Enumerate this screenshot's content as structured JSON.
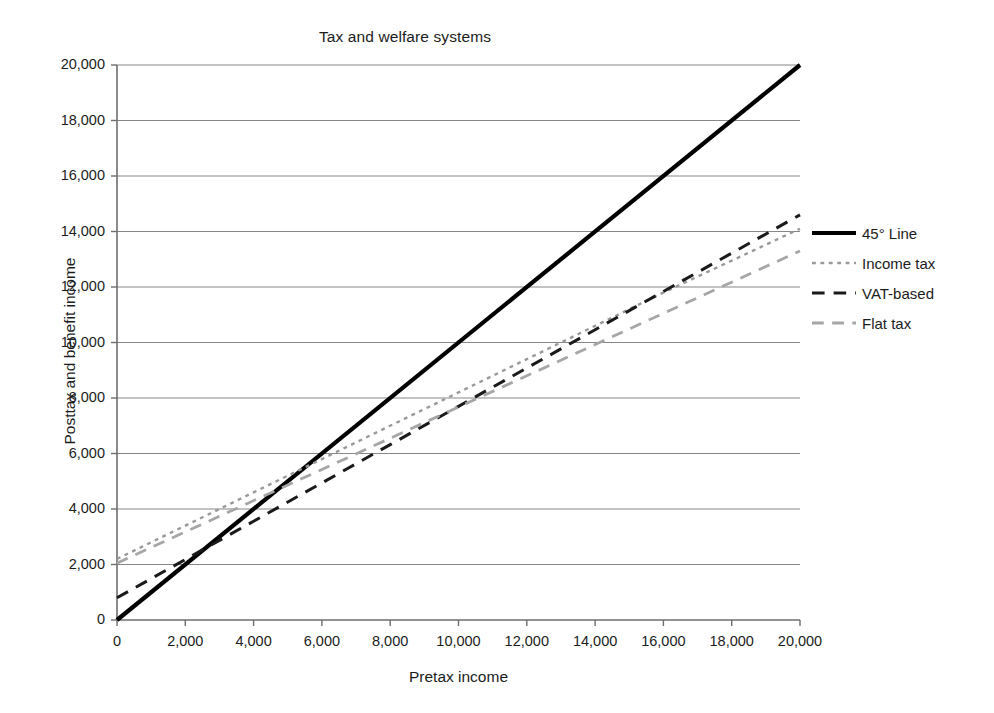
{
  "chart_data": {
    "type": "line",
    "title": "Tax and welfare systems",
    "xlabel": "Pretax income",
    "ylabel": "Posttax and benefit income",
    "xlim": [
      0,
      20000
    ],
    "ylim": [
      0,
      20000
    ],
    "xticks": [
      "0",
      "2,000",
      "4,000",
      "6,000",
      "8,000",
      "10,000",
      "12,000",
      "14,000",
      "16,000",
      "18,000",
      "20,000"
    ],
    "yticks": [
      "0",
      "2,000",
      "4,000",
      "6,000",
      "8,000",
      "10,000",
      "12,000",
      "14,000",
      "16,000",
      "18,000",
      "20,000"
    ],
    "xtick_values": [
      0,
      2000,
      4000,
      6000,
      8000,
      10000,
      12000,
      14000,
      16000,
      18000,
      20000
    ],
    "ytick_values": [
      0,
      2000,
      4000,
      6000,
      8000,
      10000,
      12000,
      14000,
      16000,
      18000,
      20000
    ],
    "grid": "horizontal",
    "legend_position": "right",
    "series": [
      {
        "name": "45° Line",
        "style": "solid",
        "color": "#000000",
        "width": 4.2,
        "x": [
          0,
          20000
        ],
        "values": [
          0,
          20000
        ]
      },
      {
        "name": "Income tax",
        "style": "dotted",
        "color": "#9a9a9a",
        "width": 2.4,
        "x": [
          0,
          2000,
          4000,
          6000,
          8000,
          10000,
          12000,
          14000,
          16000,
          18000,
          20000
        ],
        "values": [
          2200,
          3400,
          4600,
          5800,
          7000,
          8200,
          9400,
          10600,
          11800,
          12950,
          14100
        ]
      },
      {
        "name": "VAT-based",
        "style": "dashed",
        "color": "#1a1a1a",
        "width": 3.0,
        "x": [
          0,
          2000,
          4000,
          6000,
          8000,
          10000,
          12000,
          14000,
          16000,
          18000,
          20000
        ],
        "values": [
          800,
          2180,
          3560,
          4940,
          6320,
          7700,
          9080,
          10460,
          11840,
          13220,
          14600
        ]
      },
      {
        "name": "Flat tax",
        "style": "dashed",
        "color": "#a6a6a6",
        "width": 2.8,
        "x": [
          0,
          20000
        ],
        "values": [
          2050,
          13300
        ]
      }
    ]
  },
  "legend": {
    "items": [
      {
        "label": "45° Line"
      },
      {
        "label": "Income tax"
      },
      {
        "label": "VAT-based"
      },
      {
        "label": "Flat tax"
      }
    ]
  }
}
